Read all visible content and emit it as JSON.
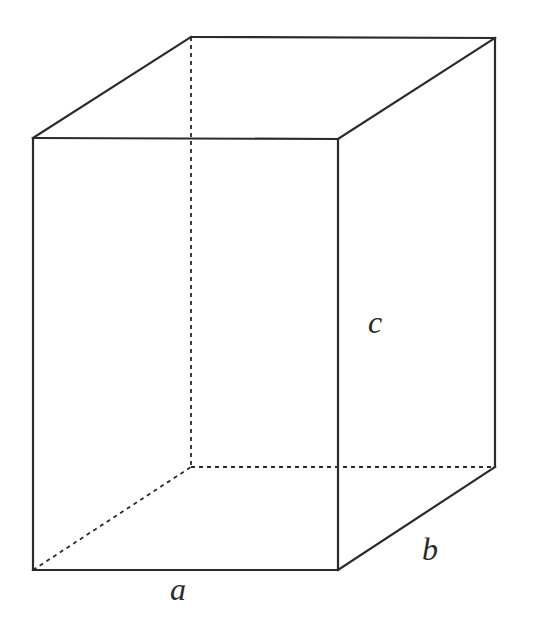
{
  "diagram": {
    "labels": {
      "a": "a",
      "b": "b",
      "c": "c"
    },
    "vertices": {
      "front_top_left": [
        33,
        138
      ],
      "front_top_right": [
        338,
        139
      ],
      "front_bottom_left": [
        33,
        570
      ],
      "front_bottom_right": [
        338,
        570
      ],
      "back_top_left": [
        191,
        37
      ],
      "back_top_right": [
        495,
        38
      ],
      "back_bottom_left": [
        191,
        467
      ],
      "back_bottom_right": [
        495,
        467
      ]
    },
    "colors": {
      "stroke": "#2b2b2b",
      "background": "#ffffff"
    }
  }
}
